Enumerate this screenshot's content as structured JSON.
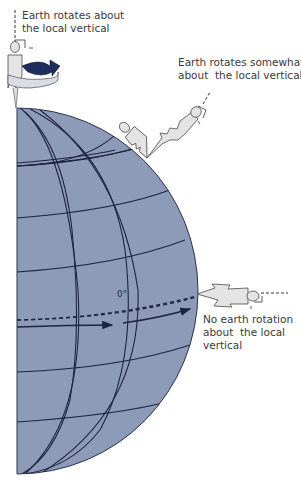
{
  "diagram": {
    "labels": {
      "pole": "Earth rotates about\nthe local vertical",
      "midlatitude": "Earth rotates somewhat\nabout  the local vertical",
      "equator": "No earth rotation\nabout  the local\nvertical",
      "equator_line": "0°"
    },
    "colors": {
      "globe_fill": "#8d9bb8",
      "grid_line": "#1d2540",
      "figure_fill": "#e4e4e4",
      "figure_stroke": "#4a4a4a",
      "rotation_arrow": "#1f2d5c",
      "ring_fill": "#d8dde6",
      "text": "#3a3a3a"
    },
    "figures": [
      {
        "position": "north-pole",
        "orientation": "vertical"
      },
      {
        "position": "mid-latitude",
        "orientation": "tilted"
      },
      {
        "position": "equator",
        "orientation": "horizontal"
      }
    ]
  }
}
